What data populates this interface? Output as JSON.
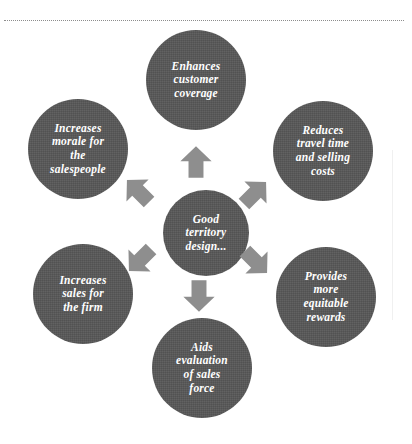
{
  "diagram": {
    "center": {
      "id": "good-territory-design",
      "label": "Good\nterritory\ndesign..."
    },
    "nodes": [
      {
        "id": "enhances-customer-coverage",
        "label": "Enhances\ncustomer\ncoverage",
        "position": "top"
      },
      {
        "id": "reduces-travel-time-and-selling-costs",
        "label": "Reduces\ntravel time\nand selling\ncosts",
        "position": "top-right"
      },
      {
        "id": "provides-more-equitable-rewards",
        "label": "Provides\nmore\nequitable\nrewards",
        "position": "bottom-right"
      },
      {
        "id": "aids-evaluation-of-sales-force",
        "label": "Aids\nevaluation\nof sales\nforce",
        "position": "bottom"
      },
      {
        "id": "increases-sales-for-the-firm",
        "label": "Increases\nsales for\nthe firm",
        "position": "bottom-left"
      },
      {
        "id": "increases-morale-for-the-salespeople",
        "label": "Increases\nmorale for\nthe\nsalespeople",
        "position": "top-left"
      }
    ],
    "arrows": [
      {
        "id": "arrow-up",
        "direction": "up"
      },
      {
        "id": "arrow-up-right",
        "direction": "up-right"
      },
      {
        "id": "arrow-down-right",
        "direction": "down-right"
      },
      {
        "id": "arrow-down",
        "direction": "down"
      },
      {
        "id": "arrow-down-left",
        "direction": "down-left"
      },
      {
        "id": "arrow-up-left",
        "direction": "up-left"
      }
    ],
    "colors": {
      "node_fill": "#575757",
      "node_text": "#ffffff",
      "arrow_fill": "#8e8e8e",
      "background": "#ffffff",
      "rule": "#8d8d8d"
    }
  }
}
